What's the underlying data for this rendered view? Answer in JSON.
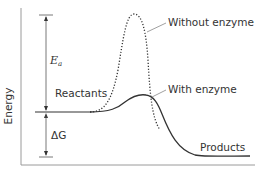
{
  "diagram": {
    "y_axis_label": "Energy",
    "labels": {
      "without_enzyme": "Without enzyme",
      "with_enzyme": "With enzyme",
      "reactants": "Reactants",
      "products": "Products",
      "activation_energy_symbol": "E",
      "activation_energy_subscript": "a",
      "free_energy_change": "ΔG"
    },
    "curves": [
      {
        "name": "Without enzyme",
        "style": "dotted",
        "peak_relative": "high"
      },
      {
        "name": "With enzyme",
        "style": "solid",
        "peak_relative": "low"
      }
    ],
    "colors": {
      "line": "#333333",
      "axis": "#888888",
      "text": "#333333"
    }
  }
}
